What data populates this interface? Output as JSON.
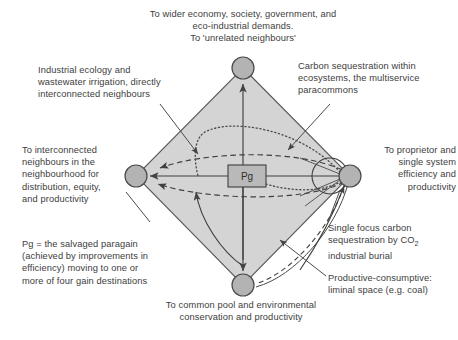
{
  "figure": {
    "type": "diagram",
    "diagram_kind": "paragain-destinations-diamond",
    "colors": {
      "diamond_fill": "#d4d4d4",
      "node_fill": "#b3b3b3",
      "stroke": "#4a4a4a",
      "text": "#3d3d3d",
      "background": "#ffffff"
    },
    "center_box": {
      "label": "Pg",
      "fill": "#b9b9b9"
    },
    "nodes": [
      {
        "id": "top",
        "name": "wider-economy-node",
        "cx": 243,
        "cy": 68,
        "r": 11
      },
      {
        "id": "left",
        "name": "interconnected-node",
        "cx": 136,
        "cy": 176,
        "r": 11
      },
      {
        "id": "right",
        "name": "proprietor-node",
        "cx": 350,
        "cy": 176,
        "r": 11
      },
      {
        "id": "bottom",
        "name": "common-pool-node",
        "cx": 243,
        "cy": 285,
        "r": 11
      }
    ],
    "labels": {
      "top": "To wider economy, society, government, and\neco-industrial demands.\nTo 'unrelated neighbours'",
      "top_left": "Industrial ecology and\nwastewater irrigation, directly\ninterconnected neighbours",
      "top_right": "Carbon sequestration within\necosystems, the multiservice\nparacommons",
      "left": "To interconnected\nneighbours in the\nneighbourhood for\ndistribution, equity,\nand productivity",
      "right": "To proprietor and\nsingle system\nefficiency and\nproductivity",
      "pg_note": "Pg = the salvaged paragain\n(achieved by improvements in\nefficiency) moving to one or\nmore of four gain destinations",
      "bottom": "To common pool and environmental\nconservation and productivity",
      "single_focus_line1": "Single focus carbon",
      "single_focus_line2_pre": "sequestration by CO",
      "single_focus_line2_sub": "2",
      "single_focus_line3": "industrial burial",
      "productive_consumptive": "Productive-consumptive:\nliminal space (e.g. coal)"
    }
  }
}
